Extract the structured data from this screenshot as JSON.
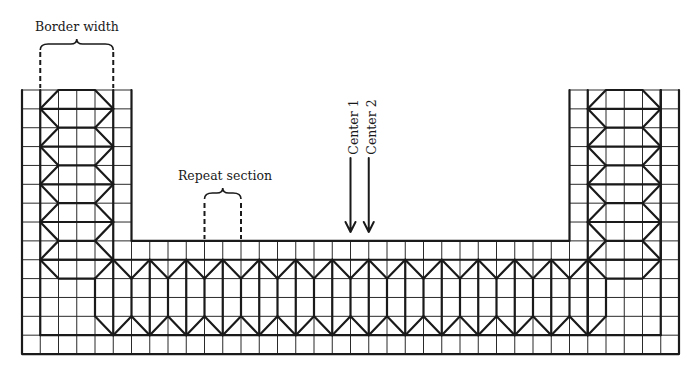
{
  "diagram": {
    "type": "knitting/needlepoint border chart",
    "grid": {
      "origin_x": 22,
      "origin_y": 90,
      "cols": 36,
      "rows": 14,
      "cell_w": 18.25,
      "cell_h": 18.86,
      "notch_left_col": 6,
      "notch_right_col": 30,
      "notch_bottom_row": 8
    },
    "border_columns": [
      {
        "side": "left",
        "from_col": 1,
        "to_col": 5
      },
      {
        "side": "right",
        "from_col": 31,
        "to_col": 35
      }
    ],
    "band": {
      "top_row": 9,
      "bottom_row": 13,
      "first_col": 5,
      "last_col": 31
    },
    "labels": {
      "border_width": "Border width",
      "repeat_section": "Repeat section",
      "center_1": "Center 1",
      "center_2": "Center 2"
    },
    "annotations": {
      "border_width": {
        "col_start": 1,
        "col_end": 5
      },
      "repeat_section": {
        "col_start": 10,
        "col_end": 12
      },
      "center_1_col": 18,
      "center_2_col": 19
    },
    "colors": {
      "ink": "#1a1a1a",
      "background": "#ffffff"
    }
  }
}
